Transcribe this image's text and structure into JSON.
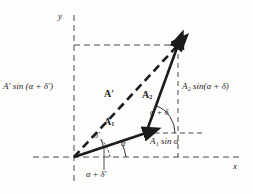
{
  "figure": {
    "background_color": "#fdfdfc",
    "ink_color": "#1b1b1b",
    "dash_color": "#4a4a4a"
  },
  "axes": {
    "x_label": "x",
    "y_label": "y",
    "origin": {
      "x": 74,
      "y": 157
    },
    "x_axis": {
      "x1": 33,
      "y1": 157,
      "x2": 240,
      "y2": 157
    },
    "y_axis": {
      "x1": 74,
      "y1": 15,
      "x2": 74,
      "y2": 181
    }
  },
  "vectors": [
    {
      "name": "A1",
      "label": "A",
      "sub": "1",
      "style": "solid",
      "from": {
        "x": 74,
        "y": 157
      },
      "to": {
        "x": 146,
        "y": 133
      },
      "label_pos": {
        "x": 108,
        "y": 122
      }
    },
    {
      "name": "A2",
      "label": "A",
      "sub": "2",
      "style": "solid",
      "from": {
        "x": 146,
        "y": 133
      },
      "to": {
        "x": 178,
        "y": 45
      },
      "label_pos": {
        "x": 145,
        "y": 95
      }
    },
    {
      "name": "A-prime",
      "label": "A′",
      "sub": "",
      "style": "dashed",
      "from": {
        "x": 74,
        "y": 157
      },
      "to": {
        "x": 178,
        "y": 45
      },
      "label_pos": {
        "x": 104,
        "y": 94
      }
    }
  ],
  "angles": [
    {
      "name": "alpha",
      "label": "α",
      "vertex": {
        "x": 74,
        "y": 157
      },
      "label_pos": {
        "x": 123,
        "y": 143
      },
      "between": [
        "x-axis",
        "A1"
      ]
    },
    {
      "name": "delta-prime",
      "label": "δ′",
      "vertex": {
        "x": 74,
        "y": 157
      },
      "label_pos": {
        "x": 96,
        "y": 136
      },
      "between": [
        "A1",
        "A-prime"
      ]
    },
    {
      "name": "alpha-plus-delta-prime",
      "label": "α + δ′",
      "vertex": {
        "x": 74,
        "y": 157
      },
      "label_pos": {
        "x": 87,
        "y": 175
      },
      "between": [
        "x-axis",
        "A-prime"
      ]
    },
    {
      "name": "alpha-plus-delta",
      "label": "α + δ",
      "vertex": {
        "x": 146,
        "y": 133
      },
      "label_pos": {
        "x": 150,
        "y": 112
      },
      "between": [
        "horizontal",
        "A2"
      ]
    }
  ],
  "projections": [
    {
      "name": "a-prime-sin-alpha-plus-delta-prime",
      "text": "A′ sin (α + δ′)",
      "pos": {
        "x": 3,
        "y": 85
      },
      "side": "left"
    },
    {
      "name": "a2-sin-alpha-plus-delta",
      "text": "A₂ sin(α + δ)",
      "pos": {
        "x": 182,
        "y": 85
      },
      "side": "right"
    },
    {
      "name": "a1-sin-alpha",
      "text": "A₁ sin α",
      "pos": {
        "x": 150,
        "y": 140
      },
      "side": "bottom"
    }
  ],
  "guides": [
    {
      "name": "top-horizontal-dashed",
      "x1": 74,
      "y1": 45,
      "x2": 178,
      "y2": 45
    },
    {
      "name": "mid-horizontal-dashed",
      "x1": 146,
      "y1": 133,
      "x2": 203,
      "y2": 133
    },
    {
      "name": "right-vertical-dashed",
      "x1": 178,
      "y1": 45,
      "x2": 178,
      "y2": 157
    },
    {
      "name": "angle-leader-dashed",
      "x1": 104,
      "y1": 146,
      "x2": 104,
      "y2": 170
    }
  ]
}
